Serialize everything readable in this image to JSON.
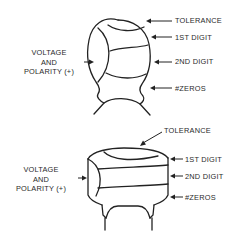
{
  "diagram": {
    "title": "",
    "capacitor_top": {
      "type": "tantalum dipped (teardrop) capacitor",
      "left_label_lines": [
        "VOLTAGE",
        "AND",
        "POLARITY (+)"
      ],
      "right_labels": [
        "TOLERANCE",
        "1ST DIGIT",
        "2ND DIGIT",
        "#ZEROS"
      ]
    },
    "capacitor_bottom": {
      "type": "disc / molded capacitor",
      "left_label_lines": [
        "VOLTAGE",
        "AND",
        "POLARITY (+)"
      ],
      "top_label": "TOLERANCE",
      "right_labels": [
        "1ST DIGIT",
        "2ND DIGIT",
        "#ZEROS"
      ]
    },
    "colors": {
      "line": "#222222",
      "background": "#ffffff",
      "text": "#2a2a2a"
    }
  }
}
